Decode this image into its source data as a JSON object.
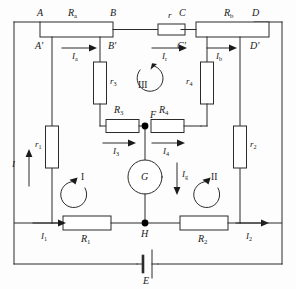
{
  "diagram": {
    "stroke_color": "#2b2b2b",
    "node_color": "#000000",
    "background": "#fdfdfd"
  },
  "nodes": [
    {
      "id": "A",
      "label": "A",
      "x": 40,
      "y": 14
    },
    {
      "id": "Ap",
      "label": "A'",
      "x": 40,
      "y": 40
    },
    {
      "id": "B",
      "label": "B",
      "x": 113,
      "y": 14
    },
    {
      "id": "Bp",
      "label": "B'",
      "x": 113,
      "y": 40
    },
    {
      "id": "C",
      "label": "C",
      "x": 181,
      "y": 14
    },
    {
      "id": "Cp",
      "label": "C'",
      "x": 181,
      "y": 40
    },
    {
      "id": "D",
      "label": "D",
      "x": 254,
      "y": 14
    },
    {
      "id": "Dp",
      "label": "D'",
      "x": 254,
      "y": 40
    },
    {
      "id": "F",
      "label": "F",
      "x": 145,
      "y": 119
    },
    {
      "id": "H",
      "label": "H",
      "x": 145,
      "y": 223
    }
  ],
  "resistors": [
    {
      "id": "Ra",
      "label": "R",
      "sub": "a",
      "orientation": "horizontal"
    },
    {
      "id": "Rb",
      "label": "R",
      "sub": "b",
      "orientation": "horizontal"
    },
    {
      "id": "r",
      "label": "r",
      "sub": "",
      "orientation": "horizontal"
    },
    {
      "id": "R3",
      "label": "R",
      "sub": "3",
      "orientation": "horizontal"
    },
    {
      "id": "R4",
      "label": "R",
      "sub": "4",
      "orientation": "horizontal"
    },
    {
      "id": "R1",
      "label": "R",
      "sub": "1",
      "orientation": "horizontal"
    },
    {
      "id": "R2",
      "label": "R",
      "sub": "2",
      "orientation": "horizontal"
    },
    {
      "id": "r1",
      "label": "r",
      "sub": "1",
      "orientation": "vertical"
    },
    {
      "id": "r2",
      "label": "r",
      "sub": "2",
      "orientation": "vertical"
    },
    {
      "id": "r3",
      "label": "r",
      "sub": "3",
      "orientation": "vertical"
    },
    {
      "id": "r4",
      "label": "r",
      "sub": "4",
      "orientation": "vertical"
    }
  ],
  "currents": [
    {
      "id": "I",
      "label": "I",
      "sub": "",
      "direction": "up"
    },
    {
      "id": "Ia",
      "label": "I",
      "sub": "a",
      "direction": "right"
    },
    {
      "id": "Ir",
      "label": "I",
      "sub": "r",
      "direction": "right"
    },
    {
      "id": "Ib",
      "label": "I",
      "sub": "b",
      "direction": "right"
    },
    {
      "id": "I3",
      "label": "I",
      "sub": "3",
      "direction": "right"
    },
    {
      "id": "I4",
      "label": "I",
      "sub": "4",
      "direction": "right"
    },
    {
      "id": "Ig",
      "label": "I",
      "sub": "g",
      "direction": "down"
    },
    {
      "id": "I1",
      "label": "I",
      "sub": "1",
      "direction": "right"
    },
    {
      "id": "I2",
      "label": "I",
      "sub": "2",
      "direction": "right"
    }
  ],
  "loops": [
    {
      "id": "loop1",
      "label": "I",
      "rotation": "counterclockwise"
    },
    {
      "id": "loop2",
      "label": "II",
      "rotation": "counterclockwise"
    },
    {
      "id": "loop3",
      "label": "III",
      "rotation": "clockwise"
    }
  ],
  "meter": {
    "label": "G",
    "name": "galvanometer"
  },
  "source": {
    "label": "E",
    "name": "battery-emf"
  }
}
